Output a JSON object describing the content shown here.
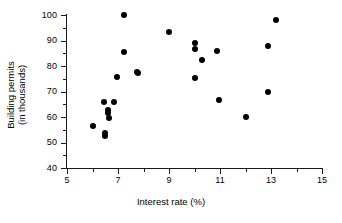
{
  "chart_data": {
    "type": "scatter",
    "title": "",
    "xlabel": "Interest rate (%)",
    "ylabel_line1": "Building permits",
    "ylabel_line2": "(in thousands)",
    "xlim": [
      5,
      15
    ],
    "ylim": [
      40,
      100
    ],
    "xticks": [
      5,
      7,
      9,
      11,
      13,
      15
    ],
    "xticks_minor": [
      6,
      8,
      10,
      12,
      14
    ],
    "yticks": [
      40,
      50,
      60,
      70,
      80,
      90,
      100
    ],
    "yticks_minor": [
      45,
      55,
      65,
      75,
      85,
      95
    ],
    "grid": false,
    "legend": false,
    "marker": "filled-circle",
    "marker_color": "#000000",
    "points": [
      {
        "x": 6.0,
        "y": 56.3
      },
      {
        "x": 6.45,
        "y": 65.7
      },
      {
        "x": 6.5,
        "y": 53.8
      },
      {
        "x": 6.5,
        "y": 52.5
      },
      {
        "x": 6.62,
        "y": 62.6
      },
      {
        "x": 6.62,
        "y": 61.6
      },
      {
        "x": 6.65,
        "y": 59.6
      },
      {
        "x": 6.85,
        "y": 65.8
      },
      {
        "x": 6.95,
        "y": 75.7
      },
      {
        "x": 7.22,
        "y": 100.0
      },
      {
        "x": 7.25,
        "y": 85.5
      },
      {
        "x": 7.75,
        "y": 77.6
      },
      {
        "x": 7.78,
        "y": 77.1
      },
      {
        "x": 9.0,
        "y": 93.4
      },
      {
        "x": 10.0,
        "y": 89.2
      },
      {
        "x": 10.0,
        "y": 86.5
      },
      {
        "x": 10.0,
        "y": 75.2
      },
      {
        "x": 10.3,
        "y": 82.4
      },
      {
        "x": 10.9,
        "y": 86.0
      },
      {
        "x": 10.95,
        "y": 66.7
      },
      {
        "x": 12.0,
        "y": 60.1
      },
      {
        "x": 12.9,
        "y": 87.7
      },
      {
        "x": 12.9,
        "y": 70.0
      },
      {
        "x": 13.2,
        "y": 98.0
      }
    ]
  }
}
